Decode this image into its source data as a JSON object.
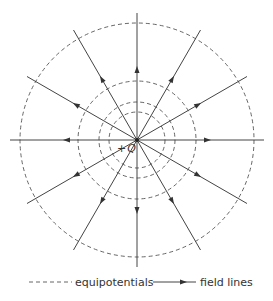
{
  "diagram": {
    "charge": {
      "label_sign": "+",
      "label_symbol": "Q",
      "center": [
        137,
        140
      ]
    },
    "equipotentials": {
      "radii": [
        28,
        38,
        59,
        117
      ],
      "style": "dashed",
      "color": "#555555"
    },
    "field_lines": {
      "count": 12,
      "angle_step_deg": 30,
      "length": 127,
      "arrow_radius": 70,
      "direction": "outward",
      "color": "#444444"
    }
  },
  "legend": {
    "equipotentials_label": "equipotentials",
    "field_lines_label": "field lines"
  }
}
